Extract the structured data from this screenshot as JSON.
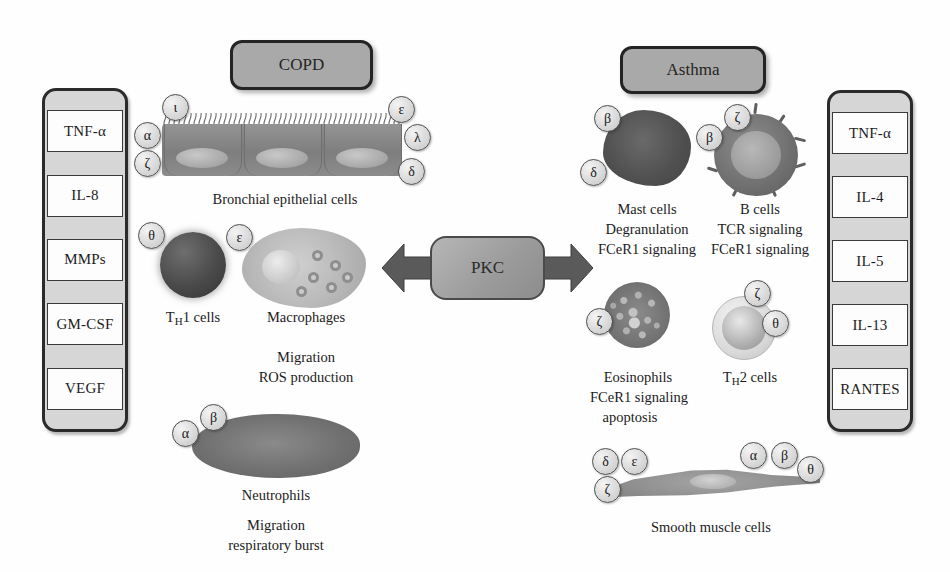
{
  "figure": {
    "title_copd": "COPD",
    "title_asthma": "Asthma",
    "center_node": "PKC"
  },
  "left_panel": {
    "name": "COPD mediators panel",
    "items": [
      "TNF-α",
      "IL-8",
      "MMPs",
      "GM-CSF",
      "VEGF"
    ]
  },
  "right_panel": {
    "name": "Asthma mediators panel",
    "items": [
      "TNF-α",
      "IL-4",
      "IL-5",
      "IL-13",
      "RANTES"
    ]
  },
  "copd_cells": [
    {
      "key": "epithelial",
      "label": "Bronchial epithelial cells",
      "functions": [],
      "badges": [
        "ι",
        "α",
        "ζ",
        "ε",
        "λ",
        "δ"
      ]
    },
    {
      "key": "th1",
      "label_pre": "T",
      "label_sub": "H",
      "label_post": "1 cells",
      "functions": [],
      "badges": [
        "θ"
      ]
    },
    {
      "key": "macrophages",
      "label": "Macrophages",
      "functions": [
        "Migration",
        "ROS production"
      ],
      "badges": [
        "ε"
      ]
    },
    {
      "key": "neutrophils",
      "label": "Neutrophils",
      "functions": [
        "Migration",
        "respiratory burst"
      ],
      "badges": [
        "α",
        "β"
      ]
    }
  ],
  "asthma_cells": [
    {
      "key": "mast",
      "label": "Mast cells",
      "functions": [
        "Degranulation",
        "FCeR1 signaling"
      ],
      "badges": [
        "β",
        "δ"
      ]
    },
    {
      "key": "bcells",
      "label": "B cells",
      "functions": [
        "TCR signaling",
        "FCeR1 signaling"
      ],
      "badges": [
        "β",
        "ζ"
      ]
    },
    {
      "key": "eosinophils",
      "label": "Eosinophils",
      "functions": [
        "FCeR1 signaling",
        "apoptosis"
      ],
      "badges": [
        "ζ"
      ]
    },
    {
      "key": "th2",
      "label_pre": "T",
      "label_sub": "H",
      "label_post": "2 cells",
      "functions": [],
      "badges": [
        "ζ",
        "θ"
      ]
    },
    {
      "key": "smooth_muscle",
      "label": "Smooth muscle cells",
      "functions": [],
      "badges": [
        "δ",
        "ε",
        "ζ",
        "α",
        "β",
        "θ"
      ]
    }
  ],
  "badges": {
    "epi_iota": "ι",
    "epi_alpha": "α",
    "epi_zeta": "ζ",
    "epi_epsilon": "ε",
    "epi_lambda": "λ",
    "epi_delta": "δ",
    "th1_theta": "θ",
    "mac_epsilon": "ε",
    "neu_alpha": "α",
    "neu_beta": "β",
    "mast_beta": "β",
    "mast_delta": "δ",
    "bcell_beta": "β",
    "bcell_zeta": "ζ",
    "eos_zeta": "ζ",
    "th2_zeta": "ζ",
    "th2_theta": "θ",
    "smc_delta": "δ",
    "smc_epsilon": "ε",
    "smc_zeta": "ζ",
    "smc_alpha": "α",
    "smc_beta": "β",
    "smc_theta": "θ"
  },
  "captions": {
    "epithelial": "Bronchial epithelial cells",
    "th1_pre": "T",
    "th1_sub": "H",
    "th1_post": "1 cells",
    "macrophages": "Macrophages",
    "mac_fn1": "Migration",
    "mac_fn2": "ROS production",
    "neutrophils": "Neutrophils",
    "neu_fn1": "Migration",
    "neu_fn2": "respiratory burst",
    "mast": "Mast cells",
    "mast_fn1": "Degranulation",
    "mast_fn2": "FCeR1 signaling",
    "bcells": "B cells",
    "bcell_fn1": "TCR signaling",
    "bcell_fn2": "FCeR1 signaling",
    "eosinophils": "Eosinophils",
    "eos_fn1": "FCeR1 signaling",
    "eos_fn2": "apoptosis",
    "th2_pre": "T",
    "th2_sub": "H",
    "th2_post": "2 cells",
    "smooth_muscle": "Smooth muscle cells"
  },
  "colors": {
    "panel_fill": "#d6d6d6",
    "panel_border": "#2b2b2b",
    "chip_fill": "#fdfdfd",
    "title_fill": "#a9a9a9",
    "arrow_fill": "#5a5a5a",
    "background": "#fefefe"
  }
}
